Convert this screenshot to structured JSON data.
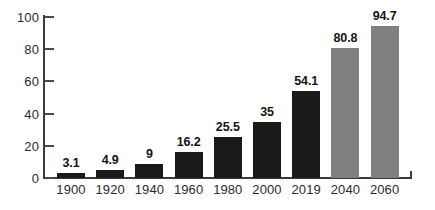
{
  "chart_data": {
    "type": "bar",
    "title": "",
    "subtitle": "",
    "xlabel": "",
    "ylabel": "",
    "categories": [
      "1900",
      "1920",
      "1940",
      "1960",
      "1980",
      "2000",
      "2019",
      "2040",
      "2060"
    ],
    "values": [
      3.1,
      4.9,
      9,
      16.2,
      25.5,
      35,
      54.1,
      80.8,
      94.7
    ],
    "value_labels": [
      "3.1",
      "4.9",
      "9",
      "16.2",
      "25.5",
      "35",
      "54.1",
      "80.8",
      "94.7"
    ],
    "bar_colors": [
      "#1a1a1a",
      "#1a1a1a",
      "#1a1a1a",
      "#1a1a1a",
      "#1a1a1a",
      "#1a1a1a",
      "#1a1a1a",
      "#808080",
      "#808080"
    ],
    "series": [
      {
        "name": "",
        "values": [
          3.1,
          4.9,
          9,
          16.2,
          25.5,
          35,
          54.1,
          80.8,
          94.7
        ]
      }
    ],
    "ylim": [
      0,
      100
    ],
    "xlim_categories": 9,
    "yticks": [
      0,
      20,
      40,
      60,
      80,
      100
    ],
    "ytick_labels": [
      "0",
      "20",
      "40",
      "60",
      "80",
      "100"
    ],
    "grid": false,
    "legend": null,
    "legend_position": "none",
    "annotations": [],
    "axis_color": "#3b3b3b",
    "label_color": "#2b2b2b",
    "background": "#ffffff"
  }
}
